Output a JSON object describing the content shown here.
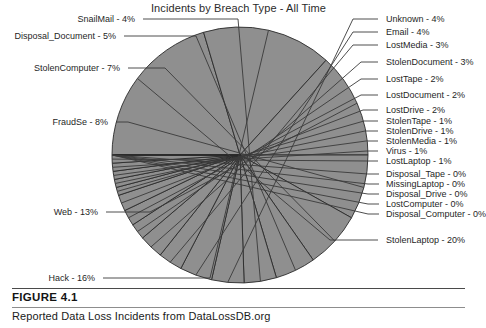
{
  "figure": {
    "number_label": "FIGURE 4.1",
    "caption": "Reported Data Loss Incidents from DataLossDB.org"
  },
  "chart_data": {
    "type": "pie",
    "title": "Incidents by Breach Type - All Time",
    "xlabel": "",
    "ylabel": "",
    "grid": false,
    "legend_position": "callout-labels",
    "slice_fill": "#8f8f8f",
    "slice_stroke": "#2a2a2a",
    "leader_color": "#3a3a3a",
    "start_angle_deg": 180,
    "direction": "clockwise",
    "center": {
      "x": 240,
      "y": 155
    },
    "radius": 128,
    "categories": [
      "StolenLaptop",
      "Hack",
      "Web",
      "FraudSe",
      "StolenComputer",
      "Disposal_Document",
      "SnailMail",
      "Unknown",
      "Email",
      "LostMedia",
      "StolenDocument",
      "LostTape",
      "LostDocument",
      "LostDrive",
      "StolenTape",
      "StolenDrive",
      "StolenMedia",
      "Virus",
      "LostLaptop",
      "Disposal_Tape",
      "MissingLaptop",
      "Disposal_Drive",
      "LostComputer",
      "Disposal_Computer"
    ],
    "values": [
      20,
      16,
      13,
      8,
      7,
      5,
      4,
      4,
      4,
      3,
      3,
      2,
      2,
      2,
      1,
      1,
      1,
      1,
      1,
      0,
      0,
      0,
      0,
      0
    ],
    "labels": [
      {
        "name": "StolenLaptop",
        "pct": "20%",
        "text": "StolenLaptop - 20%",
        "side": "right"
      },
      {
        "name": "Hack",
        "pct": "16%",
        "text": "Hack - 16%",
        "side": "left"
      },
      {
        "name": "Web",
        "pct": "13%",
        "text": "Web - 13%",
        "side": "left"
      },
      {
        "name": "FraudSe",
        "pct": "8%",
        "text": "FraudSe - 8%",
        "side": "left"
      },
      {
        "name": "StolenComputer",
        "pct": "7%",
        "text": "StolenComputer - 7%",
        "side": "left"
      },
      {
        "name": "Disposal_Document",
        "pct": "5%",
        "text": "Disposal_Document - 5%",
        "side": "left"
      },
      {
        "name": "SnailMail",
        "pct": "4%",
        "text": "SnailMail - 4%",
        "side": "left"
      },
      {
        "name": "Unknown",
        "pct": "4%",
        "text": "Unknown - 4%",
        "side": "right"
      },
      {
        "name": "Email",
        "pct": "4%",
        "text": "Email - 4%",
        "side": "right"
      },
      {
        "name": "LostMedia",
        "pct": "3%",
        "text": "LostMedia - 3%",
        "side": "right"
      },
      {
        "name": "StolenDocument",
        "pct": "3%",
        "text": "StolenDocument - 3%",
        "side": "right"
      },
      {
        "name": "LostTape",
        "pct": "2%",
        "text": "LostTape - 2%",
        "side": "right"
      },
      {
        "name": "LostDocument",
        "pct": "2%",
        "text": "LostDocument - 2%",
        "side": "right"
      },
      {
        "name": "LostDrive",
        "pct": "2%",
        "text": "LostDrive - 2%",
        "side": "right"
      },
      {
        "name": "StolenTape",
        "pct": "1%",
        "text": "StolenTape - 1%",
        "side": "right"
      },
      {
        "name": "StolenDrive",
        "pct": "1%",
        "text": "StolenDrive - 1%",
        "side": "right"
      },
      {
        "name": "StolenMedia",
        "pct": "1%",
        "text": "StolenMedia - 1%",
        "side": "right"
      },
      {
        "name": "Virus",
        "pct": "1%",
        "text": "Virus - 1%",
        "side": "right"
      },
      {
        "name": "LostLaptop",
        "pct": "1%",
        "text": "LostLaptop - 1%",
        "side": "right"
      },
      {
        "name": "Disposal_Tape",
        "pct": "0%",
        "text": "Disposal_Tape - 0%",
        "side": "right"
      },
      {
        "name": "MissingLaptop",
        "pct": "0%",
        "text": "MissingLaptop - 0%",
        "side": "right"
      },
      {
        "name": "Disposal_Drive",
        "pct": "0%",
        "text": "Disposal_Drive - 0%",
        "side": "right"
      },
      {
        "name": "LostComputer",
        "pct": "0%",
        "text": "LostComputer - 0%",
        "side": "right"
      },
      {
        "name": "Disposal_Computer",
        "pct": "0%",
        "text": "Disposal_Computer - 0%",
        "side": "right"
      }
    ]
  },
  "label_layout": {
    "right": [
      {
        "key": "Unknown",
        "text_x": 386,
        "text_y": 19,
        "elbow_x": 378,
        "anchor_x": 353
      },
      {
        "key": "Email",
        "text_x": 386,
        "text_y": 32,
        "elbow_x": 378,
        "anchor_x": 353
      },
      {
        "key": "LostMedia",
        "text_x": 386,
        "text_y": 45,
        "elbow_x": 378,
        "anchor_x": 353
      },
      {
        "key": "StolenDocument",
        "text_x": 386,
        "text_y": 62,
        "elbow_x": 378,
        "anchor_x": 361
      },
      {
        "key": "LostTape",
        "text_x": 386,
        "text_y": 79,
        "elbow_x": 378,
        "anchor_x": 361
      },
      {
        "key": "LostDocument",
        "text_x": 386,
        "text_y": 95,
        "elbow_x": 378,
        "anchor_x": 361
      },
      {
        "key": "LostDrive",
        "text_x": 386,
        "text_y": 110,
        "elbow_x": 378,
        "anchor_x": 363
      },
      {
        "key": "StolenTape",
        "text_x": 386,
        "text_y": 121,
        "elbow_x": 378,
        "anchor_x": 364
      },
      {
        "key": "StolenDrive",
        "text_x": 386,
        "text_y": 131,
        "elbow_x": 378,
        "anchor_x": 365
      },
      {
        "key": "StolenMedia",
        "text_x": 386,
        "text_y": 141,
        "elbow_x": 378,
        "anchor_x": 366
      },
      {
        "key": "Virus",
        "text_x": 386,
        "text_y": 151,
        "elbow_x": 378,
        "anchor_x": 367
      },
      {
        "key": "LostLaptop",
        "text_x": 386,
        "text_y": 161,
        "elbow_x": 378,
        "anchor_x": 368
      },
      {
        "key": "Disposal_Tape",
        "text_x": 386,
        "text_y": 174,
        "elbow_x": 379,
        "anchor_x": 368
      },
      {
        "key": "MissingLaptop",
        "text_x": 386,
        "text_y": 184,
        "elbow_x": 379,
        "anchor_x": 368
      },
      {
        "key": "Disposal_Drive",
        "text_x": 386,
        "text_y": 194,
        "elbow_x": 379,
        "anchor_x": 368
      },
      {
        "key": "LostComputer",
        "text_x": 386,
        "text_y": 204,
        "elbow_x": 379,
        "anchor_x": 368
      },
      {
        "key": "Disposal_Computer",
        "text_x": 386,
        "text_y": 214,
        "elbow_x": 379,
        "anchor_x": 368
      },
      {
        "key": "StolenLaptop",
        "text_x": 386,
        "text_y": 240,
        "elbow_x": 378,
        "anchor_x": 330
      }
    ],
    "left": [
      {
        "key": "SnailMail",
        "text_x": 135,
        "text_y": 19,
        "elbow_x": 143,
        "anchor_x": 238
      },
      {
        "key": "Disposal_Document",
        "text_x": 116,
        "text_y": 36,
        "elbow_x": 124,
        "anchor_x": 196
      },
      {
        "key": "StolenComputer",
        "text_x": 120,
        "text_y": 68,
        "elbow_x": 128,
        "anchor_x": 165
      },
      {
        "key": "FraudSe",
        "text_x": 108,
        "text_y": 122,
        "elbow_x": 116,
        "anchor_x": 128
      },
      {
        "key": "Web",
        "text_x": 98,
        "text_y": 212,
        "elbow_x": 106,
        "anchor_x": 150
      },
      {
        "key": "Hack",
        "text_x": 95,
        "text_y": 278,
        "elbow_x": 103,
        "anchor_x": 210
      }
    ]
  }
}
